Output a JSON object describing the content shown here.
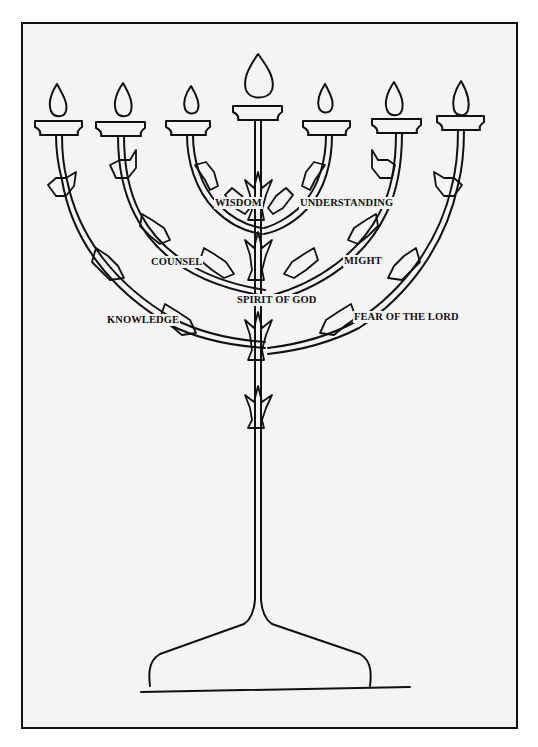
{
  "diagram": {
    "type": "menorah",
    "lamps": 7,
    "center_label": "SPIRIT OF GOD",
    "labels": {
      "wisdom": "WISDOM",
      "understanding": "UNDERSTANDING",
      "counsel": "COUNSEL",
      "might": "MIGHT",
      "spirit": "SPIRIT OF GOD",
      "knowledge": "KNOWLEDGE",
      "fear": "FEAR OF THE LORD"
    },
    "colors": {
      "line": "#111111",
      "background": "#f4f4f4",
      "border": "#111111"
    }
  }
}
